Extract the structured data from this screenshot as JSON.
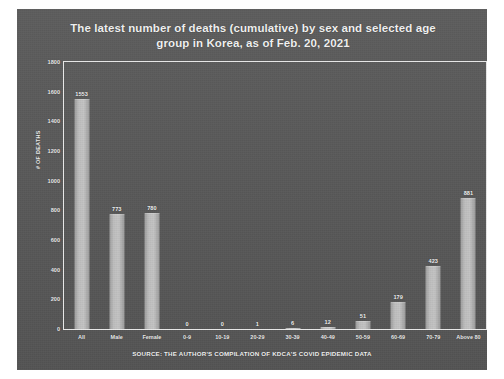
{
  "chart_data": {
    "type": "bar",
    "title": "The latest number of deaths (cumulative) by sex and selected age group in Korea, as of Feb. 20, 2021",
    "title_line1": "The latest number of deaths (cumulative) by sex and selected age",
    "title_line2": "group in Korea, as of Feb. 20, 2021",
    "xlabel": "",
    "ylabel": "# OF DEATHS",
    "ylim": [
      0,
      1800
    ],
    "ytick_labels": [
      "0",
      "200",
      "400",
      "600",
      "800",
      "1000",
      "1200",
      "1400",
      "1600",
      "1800"
    ],
    "ytick_values": [
      0,
      200,
      400,
      600,
      800,
      1000,
      1200,
      1400,
      1600,
      1800
    ],
    "grid": false,
    "legend": "none",
    "categories": [
      "All",
      "Male",
      "Female",
      "0-9",
      "10-19",
      "20-29",
      "30-39",
      "40-49",
      "50-59",
      "60-69",
      "70-79",
      "Above 80"
    ],
    "values": [
      1553,
      773,
      780,
      0,
      0,
      1,
      6,
      12,
      51,
      179,
      423,
      881
    ],
    "data_labels": [
      "1553",
      "773",
      "780",
      "0",
      "0",
      "1",
      "6",
      "12",
      "51",
      "179",
      "423",
      "881"
    ],
    "bar_color": "#bdbdbd",
    "background_color": "#575757",
    "text_color": "#f2f2f2",
    "source_note": "SOURCE: THE AUTHOR'S COMPILATION OF KDCA'S COVID EPIDEMIC DATA"
  }
}
